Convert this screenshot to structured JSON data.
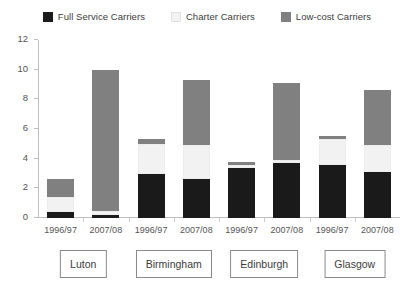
{
  "chart_data": {
    "type": "bar",
    "subtype": "stacked-grouped",
    "title": "",
    "xlabel": "",
    "ylabel": "",
    "ylim": [
      0,
      12
    ],
    "ytick_values": [
      0,
      2,
      4,
      6,
      8,
      10,
      12
    ],
    "ytick_labels": [
      "0",
      "2",
      "4",
      "6",
      "8",
      "10",
      "12"
    ],
    "grid": false,
    "legend_position": "top-center",
    "categories": [
      "1996/97",
      "2007/08",
      "1996/97",
      "2007/08",
      "1996/97",
      "2007/08",
      "1996/97",
      "2007/08"
    ],
    "groups": [
      {
        "label": "Luton",
        "categories": [
          "1996/97",
          "2007/08"
        ]
      },
      {
        "label": "Birmingham",
        "categories": [
          "1996/97",
          "2007/08"
        ]
      },
      {
        "label": "Edinburgh",
        "categories": [
          "1996/97",
          "2007/08"
        ]
      },
      {
        "label": "Glasgow",
        "categories": [
          "1996/97",
          "2007/08"
        ]
      }
    ],
    "series": [
      {
        "name": "Full Service Carriers",
        "color": "#1a1a1a",
        "values": [
          0.4,
          0.2,
          3.0,
          2.6,
          3.4,
          3.7,
          3.6,
          3.1
        ]
      },
      {
        "name": "Charter Carriers",
        "color": "#f2f2f2",
        "values": [
          1.0,
          0.3,
          2.0,
          2.3,
          0.2,
          0.2,
          1.7,
          1.8
        ]
      },
      {
        "name": "Low-cost Carriers",
        "color": "#808080",
        "values": [
          1.2,
          9.5,
          0.3,
          4.4,
          0.15,
          5.2,
          0.2,
          3.75
        ]
      }
    ],
    "totals": [
      2.6,
      10.0,
      5.3,
      9.3,
      3.75,
      9.1,
      5.5,
      8.65
    ]
  },
  "legend": {
    "items": [
      {
        "label": "Full Service Carriers",
        "color": "#1a1a1a"
      },
      {
        "label": "Charter Carriers",
        "color": "#f2f2f2"
      },
      {
        "label": "Low-cost Carriers",
        "color": "#808080"
      }
    ]
  },
  "colors": {
    "axis": "#bfbfbf",
    "tick_text": "#555555",
    "legend_text": "#3c3c3c",
    "box_border": "#8a8a8a",
    "background": "#ffffff"
  }
}
